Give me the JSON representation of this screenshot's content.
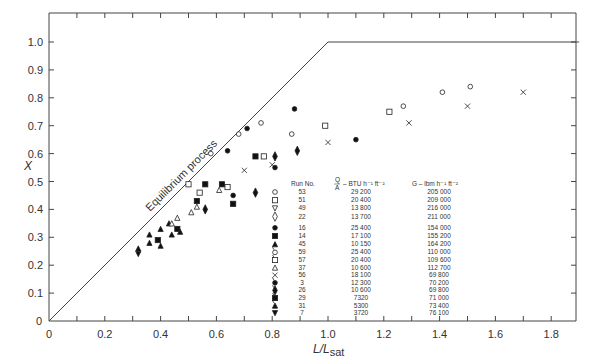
{
  "chart_data": {
    "type": "scatter",
    "title": "",
    "xlabel": "L/Lsat",
    "xlabel_main": "L/L",
    "xlabel_sub": "sat",
    "ylabel": "X",
    "xlim": [
      0,
      1.9
    ],
    "ylim": [
      0,
      1.1
    ],
    "x_ticks": [
      "0",
      "0.2",
      "0.4",
      "0.6",
      "0.8",
      "1.0",
      "1.2",
      "1.4",
      "1.6",
      "1.8"
    ],
    "y_ticks": [
      "0",
      "0.1",
      "0.2",
      "0.3",
      "0.4",
      "0.5",
      "0.6",
      "0.7",
      "0.8",
      "0.9",
      "1.0"
    ],
    "grid": false,
    "annotation": "Equilibrium process",
    "equilibrium_line": [
      [
        0,
        0
      ],
      [
        1.0,
        1.0
      ],
      [
        1.9,
        1.0
      ]
    ],
    "legend_headers": {
      "run": "Run No.",
      "qa_num": "Q",
      "qa_den": "A",
      "qa_unit": "– BTU h⁻¹ ft⁻²",
      "g": "G – lbm h⁻¹ ft⁻²"
    },
    "legend": [
      {
        "symbol": "open-circle",
        "run": "53",
        "qa": "29 200",
        "g": "205 000"
      },
      {
        "symbol": "open-square",
        "run": "51",
        "qa": "20 400",
        "g": "209 000"
      },
      {
        "symbol": "open-triangle-down",
        "run": "49",
        "qa": "13 800",
        "g": "216 000"
      },
      {
        "symbol": "open-diamond",
        "run": "22",
        "qa": "13 700",
        "g": "211 000"
      },
      {
        "symbol": "filled-circle",
        "run": "16",
        "qa": "25 400",
        "g": "154 000"
      },
      {
        "symbol": "filled-square",
        "run": "14",
        "qa": "17 100",
        "g": "155 200"
      },
      {
        "symbol": "filled-triangle-up",
        "run": "45",
        "qa": "10 150",
        "g": "164 200"
      },
      {
        "symbol": "open-circle-flag",
        "run": "59",
        "qa": "25 400",
        "g": "110 000"
      },
      {
        "symbol": "open-square-flag",
        "run": "57",
        "qa": "20 400",
        "g": "109 600"
      },
      {
        "symbol": "open-triangle-up",
        "run": "37",
        "qa": "10 600",
        "g": "112 700"
      },
      {
        "symbol": "cross",
        "run": "56",
        "qa": "18 100",
        "g": "69 800"
      },
      {
        "symbol": "filled-circle-flag",
        "run": "3",
        "qa": "12 300",
        "g": "70 200"
      },
      {
        "symbol": "filled-diamond-flag",
        "run": "26",
        "qa": "10 600",
        "g": "69 800"
      },
      {
        "symbol": "filled-square-flag",
        "run": "29",
        "qa": "7320",
        "g": "71 000"
      },
      {
        "symbol": "filled-triangle-flag",
        "run": "31",
        "qa": "5300",
        "g": "73 400"
      },
      {
        "symbol": "filled-triangle-down",
        "run": "7",
        "qa": "3720",
        "g": "76 100"
      }
    ],
    "series": [
      {
        "name": "open-circle",
        "points": [
          [
            0.58,
            0.6
          ],
          [
            0.68,
            0.67
          ],
          [
            0.76,
            0.71
          ],
          [
            0.87,
            0.67
          ],
          [
            1.27,
            0.77
          ],
          [
            1.41,
            0.82
          ],
          [
            1.51,
            0.84
          ]
        ]
      },
      {
        "name": "open-square",
        "points": [
          [
            0.5,
            0.49
          ],
          [
            0.54,
            0.46
          ],
          [
            0.64,
            0.48
          ],
          [
            0.77,
            0.59
          ],
          [
            0.99,
            0.7
          ],
          [
            1.22,
            0.75
          ]
        ]
      },
      {
        "name": "cross",
        "points": [
          [
            0.7,
            0.54
          ],
          [
            0.8,
            0.56
          ],
          [
            1.0,
            0.64
          ],
          [
            1.29,
            0.71
          ],
          [
            1.5,
            0.77
          ],
          [
            1.7,
            0.82
          ]
        ]
      },
      {
        "name": "filled-circle",
        "points": [
          [
            0.64,
            0.61
          ],
          [
            0.71,
            0.69
          ],
          [
            0.88,
            0.76
          ],
          [
            0.81,
            0.55
          ],
          [
            0.66,
            0.45
          ],
          [
            1.1,
            0.65
          ]
        ]
      },
      {
        "name": "filled-square",
        "points": [
          [
            0.39,
            0.29
          ],
          [
            0.46,
            0.33
          ],
          [
            0.53,
            0.43
          ],
          [
            0.56,
            0.49
          ],
          [
            0.66,
            0.42
          ],
          [
            0.62,
            0.49
          ],
          [
            0.74,
            0.59
          ]
        ]
      },
      {
        "name": "filled-triangle-up",
        "points": [
          [
            0.32,
            0.26
          ],
          [
            0.36,
            0.31
          ],
          [
            0.36,
            0.28
          ],
          [
            0.4,
            0.33
          ],
          [
            0.43,
            0.35
          ],
          [
            0.4,
            0.27
          ],
          [
            0.44,
            0.31
          ],
          [
            0.47,
            0.32
          ]
        ]
      },
      {
        "name": "filled-diamond",
        "points": [
          [
            0.56,
            0.4
          ],
          [
            0.81,
            0.59
          ],
          [
            0.89,
            0.61
          ],
          [
            0.74,
            0.46
          ]
        ]
      },
      {
        "name": "open-triangle",
        "points": [
          [
            0.46,
            0.37
          ],
          [
            0.51,
            0.39
          ],
          [
            0.53,
            0.41
          ],
          [
            0.61,
            0.47
          ],
          [
            0.44,
            0.35
          ]
        ]
      },
      {
        "name": "filled-triangle-down",
        "points": [
          [
            0.32,
            0.24
          ]
        ]
      }
    ]
  }
}
